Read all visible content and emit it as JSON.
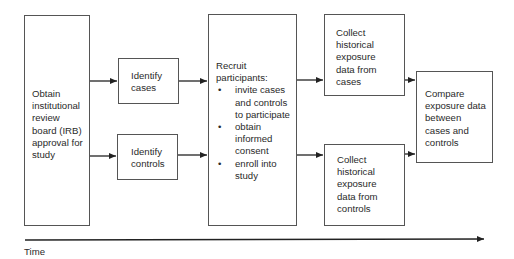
{
  "diagram": {
    "steps": {
      "irb": {
        "label": "Obtain institutional review board (IRB) approval for study",
        "lines": [
          "Obtain",
          "institutional",
          "review",
          "board (IRB)",
          "approval for",
          "study"
        ]
      },
      "identify_cases": {
        "lines": [
          "Identify",
          "cases"
        ]
      },
      "identify_controls": {
        "lines": [
          "Identify",
          "controls"
        ]
      },
      "recruit": {
        "title_lines": [
          "Recruit",
          "participants:"
        ],
        "bullets": [
          {
            "lines": [
              "invite cases",
              "and controls",
              "to participate"
            ]
          },
          {
            "lines": [
              "obtain",
              "informed",
              "consent"
            ]
          },
          {
            "lines": [
              "enroll into",
              "study"
            ]
          }
        ]
      },
      "collect_cases": {
        "lines": [
          "Collect",
          "historical",
          "exposure",
          "data from",
          "cases"
        ]
      },
      "collect_controls": {
        "lines": [
          "Collect",
          "historical",
          "exposure",
          "data from",
          "controls"
        ]
      },
      "compare": {
        "lines": [
          "Compare",
          "exposure data",
          "between",
          "cases and",
          "controls"
        ]
      }
    },
    "bullet_glyph": "•",
    "axis": {
      "label": "Time"
    }
  }
}
